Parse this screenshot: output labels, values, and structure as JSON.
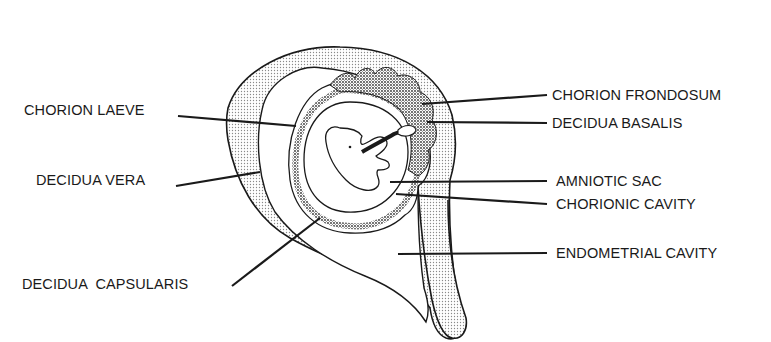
{
  "diagram": {
    "type": "anatomical-illustration",
    "colors": {
      "ink": "#1a1a1a",
      "stipple": "#9a9a9a",
      "background": "#ffffff"
    },
    "labels_left": [
      {
        "id": "chorion-laeve",
        "text": "CHORION LAEVE",
        "x": 24,
        "y": 110
      },
      {
        "id": "decidua-vera",
        "text": "DECIDUA VERA",
        "x": 36,
        "y": 180
      },
      {
        "id": "decidua-capsularis",
        "text": "DECIDUA  CAPSULARIS",
        "x": 22,
        "y": 280
      }
    ],
    "labels_right": [
      {
        "id": "chorion-frondosum",
        "text": "CHORION FRONDOSUM",
        "x": 552,
        "y": 89
      },
      {
        "id": "decidua-basalis",
        "text": "DECIDUA BASALIS",
        "x": 552,
        "y": 118
      },
      {
        "id": "amniotic-sac",
        "text": "AMNIOTIC SAC",
        "x": 556,
        "y": 177
      },
      {
        "id": "chorionic-cavity",
        "text": "CHORIONIC CAVITY",
        "x": 556,
        "y": 200
      },
      {
        "id": "endometrial-cavity",
        "text": "ENDOMETRIAL CAVITY",
        "x": 556,
        "y": 247
      }
    ]
  }
}
